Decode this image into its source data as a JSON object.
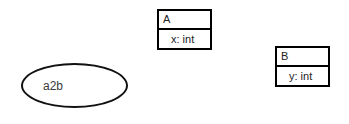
{
  "diagram": {
    "background_color": "#ffffff",
    "stroke_color": "#000000",
    "text_color": "#222222",
    "classes": [
      {
        "id": "A",
        "name": "A",
        "attributes": [
          {
            "text": "x: int",
            "field": "x",
            "type": "int"
          }
        ]
      },
      {
        "id": "B",
        "name": "B",
        "attributes": [
          {
            "text": "y: int",
            "field": "y",
            "type": "int"
          }
        ]
      }
    ],
    "ellipses": [
      {
        "id": "a2b",
        "label": "a2b"
      }
    ]
  }
}
